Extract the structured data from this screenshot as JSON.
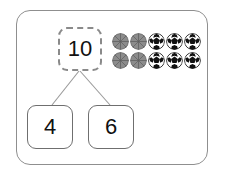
{
  "worksheet": {
    "type": "number-bond",
    "frame": {
      "border_color": "#8f8f8f",
      "background": "#ffffff"
    },
    "number_bond": {
      "total": {
        "value": "10",
        "style": "dashed",
        "border_color": "#8a8a8a"
      },
      "parts": [
        {
          "value": "4",
          "style": "solid",
          "border_color": "#6f6f6f"
        },
        {
          "value": "6",
          "style": "solid",
          "border_color": "#6f6f6f"
        }
      ],
      "connector_color": "#9a9a9a"
    },
    "counters": {
      "total_count": 10,
      "rows": 2,
      "columns": 5,
      "groups": [
        {
          "name": "basketball",
          "count": 4,
          "fill": "#8c8c8c",
          "line": "#5d5d5d"
        },
        {
          "name": "soccer-ball",
          "count": 6,
          "fill": "#ffffff",
          "line": "#111111"
        }
      ],
      "layout": [
        [
          "basketball",
          "basketball",
          "soccer-ball",
          "soccer-ball",
          "soccer-ball"
        ],
        [
          "basketball",
          "basketball",
          "soccer-ball",
          "soccer-ball",
          "soccer-ball"
        ]
      ]
    }
  }
}
